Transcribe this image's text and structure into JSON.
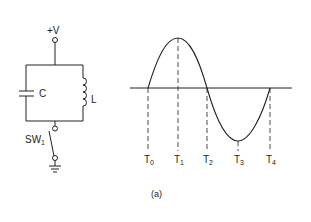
{
  "circuit": {
    "supply_label": "+V",
    "capacitor_label": "C",
    "inductor_label": "L",
    "switch_label": "SW",
    "switch_subscript": "1"
  },
  "waveform": {
    "type": "sine",
    "time_labels": [
      {
        "base": "T",
        "sub": "0"
      },
      {
        "base": "T",
        "sub": "1"
      },
      {
        "base": "T",
        "sub": "2"
      },
      {
        "base": "T",
        "sub": "3"
      },
      {
        "base": "T",
        "sub": "4"
      }
    ]
  },
  "caption": "(a)"
}
